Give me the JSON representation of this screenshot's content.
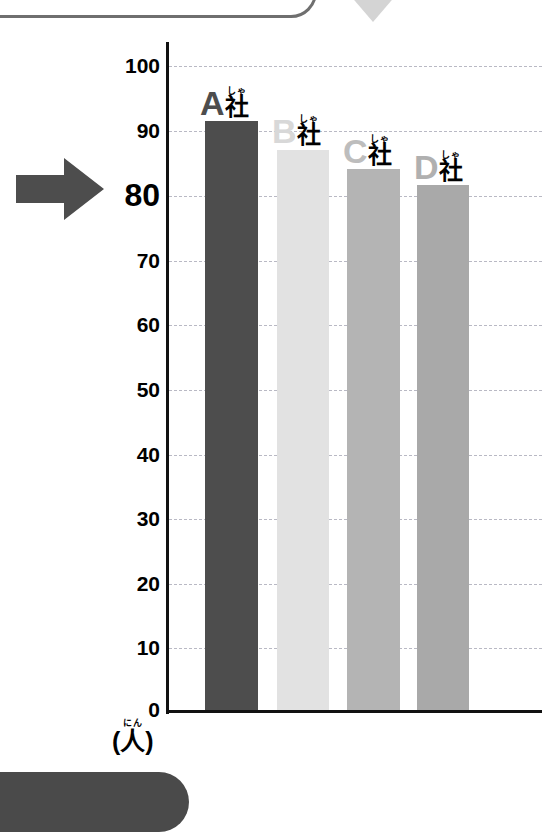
{
  "chart_data": {
    "type": "bar",
    "title": "",
    "subtitle": "",
    "xlabel": "",
    "ylabel": "(人)",
    "ylabel_ruby": "にん",
    "ylim": [
      0,
      100
    ],
    "grid": true,
    "legend": "none",
    "categories": [
      "A社",
      "B社",
      "C社",
      "D社"
    ],
    "values": [
      91.5,
      87,
      84,
      81.5
    ],
    "ytick_labels": [
      "100",
      "90",
      "80",
      "70",
      "60",
      "50",
      "40",
      "30",
      "20",
      "10",
      "0"
    ],
    "ytick_values": [
      100,
      90,
      80,
      70,
      60,
      50,
      40,
      30,
      20,
      10,
      0
    ],
    "highlighted_tick": "80",
    "bars": [
      {
        "letter": "A",
        "suffix": "社",
        "ruby": "しゃ",
        "value": 91.5,
        "color": "#4d4d4d",
        "letter_color": "#4d4d4d"
      },
      {
        "letter": "B",
        "suffix": "社",
        "ruby": "しゃ",
        "value": 87,
        "color": "#e2e2e2",
        "letter_color": "#d8d8d8"
      },
      {
        "letter": "C",
        "suffix": "社",
        "ruby": "しゃ",
        "value": 84,
        "color": "#b4b4b4",
        "letter_color": "#bdbdbd"
      },
      {
        "letter": "D",
        "suffix": "社",
        "ruby": "しゃ",
        "value": 81.5,
        "color": "#a9a9a9",
        "letter_color": "#b0b0b0"
      }
    ]
  },
  "axis": {
    "tick_100": "100",
    "tick_90": "90",
    "tick_80": "80",
    "tick_70": "70",
    "tick_60": "60",
    "tick_50": "50",
    "tick_40": "40",
    "tick_30": "30",
    "tick_20": "20",
    "tick_10": "10",
    "tick_0": "0",
    "unit_ruby": "にん",
    "unit_text": "(人)"
  },
  "annotations": {
    "pointer_arrow": "right-arrow-pointing-at-80",
    "pointer_color": "#4d4d4d",
    "top_triangle_color": "#d4d4d4",
    "frame_outline_color": "#6f6f6f",
    "bottom_blob_color": "#4a4a4a"
  },
  "labels": {
    "bar_a_letter": "A",
    "bar_a_suffix": "社",
    "bar_a_ruby": "しゃ",
    "bar_b_letter": "B",
    "bar_b_suffix": "社",
    "bar_b_ruby": "しゃ",
    "bar_c_letter": "C",
    "bar_c_suffix": "社",
    "bar_c_ruby": "しゃ",
    "bar_d_letter": "D",
    "bar_d_suffix": "社",
    "bar_d_ruby": "しゃ"
  }
}
